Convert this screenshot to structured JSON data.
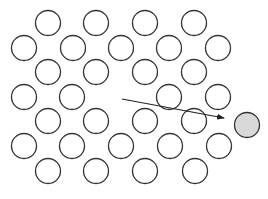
{
  "diagram": {
    "colors": {
      "background": "#ffffff",
      "stroke": "#333333",
      "atom_fill": "#ffffff",
      "highlight_fill": "#d9d9d9",
      "arrow": "#222222"
    },
    "radius": 12.5,
    "atoms": [
      {
        "x": 48,
        "y": 23
      },
      {
        "x": 96,
        "y": 23
      },
      {
        "x": 145,
        "y": 23
      },
      {
        "x": 194,
        "y": 23
      },
      {
        "x": 24,
        "y": 48
      },
      {
        "x": 73,
        "y": 48
      },
      {
        "x": 121,
        "y": 48
      },
      {
        "x": 169,
        "y": 48
      },
      {
        "x": 218,
        "y": 48
      },
      {
        "x": 48,
        "y": 72
      },
      {
        "x": 96,
        "y": 72
      },
      {
        "x": 145,
        "y": 72
      },
      {
        "x": 194,
        "y": 72
      },
      {
        "x": 24,
        "y": 97
      },
      {
        "x": 72,
        "y": 97
      },
      {
        "x": 169,
        "y": 97
      },
      {
        "x": 218,
        "y": 97
      },
      {
        "x": 48,
        "y": 121
      },
      {
        "x": 96,
        "y": 121
      },
      {
        "x": 145,
        "y": 121
      },
      {
        "x": 194,
        "y": 121
      },
      {
        "x": 24,
        "y": 146
      },
      {
        "x": 72,
        "y": 146
      },
      {
        "x": 121,
        "y": 146
      },
      {
        "x": 170,
        "y": 146
      },
      {
        "x": 219,
        "y": 146
      },
      {
        "x": 48,
        "y": 171
      },
      {
        "x": 96,
        "y": 171
      },
      {
        "x": 145,
        "y": 171
      },
      {
        "x": 195,
        "y": 171
      }
    ],
    "vacancy": {
      "x": 121,
      "y": 97
    },
    "displaced_atom": {
      "x": 247,
      "y": 125
    },
    "arrow": {
      "x1": 122,
      "y1": 99,
      "x2": 224,
      "y2": 118
    }
  }
}
